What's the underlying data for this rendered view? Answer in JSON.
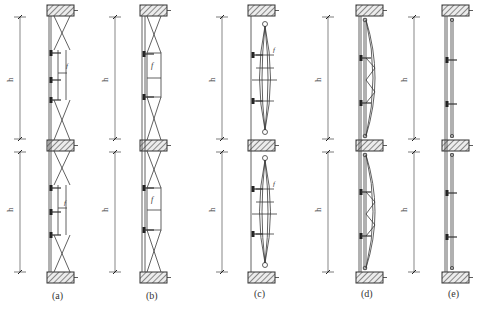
{
  "figure": {
    "panels": [
      {
        "id": "a",
        "caption": "(a)",
        "type": "cross-braced cable truss with glass fins",
        "height_labels": [
          "h",
          "h"
        ],
        "annotation": "f"
      },
      {
        "id": "b",
        "caption": "(b)",
        "type": "cross-braced truss frame",
        "height_labels": [
          "h",
          "h"
        ],
        "annotation": "f"
      },
      {
        "id": "c",
        "caption": "(c)",
        "type": "fish-belly spindle cable truss",
        "height_labels": [
          "h",
          "h"
        ],
        "annotation": "f"
      },
      {
        "id": "d",
        "caption": "(d)",
        "type": "arched steel truss",
        "height_labels": [
          "h",
          "h"
        ]
      },
      {
        "id": "e",
        "caption": "(e)",
        "type": "single mullion with brackets",
        "height_labels": [
          "h",
          "h"
        ]
      }
    ]
  },
  "colors": {
    "line": "#3a3a3a",
    "slab_fill": "#e8e8e8",
    "hatch": "#3a3a3a",
    "background": "#ffffff"
  }
}
